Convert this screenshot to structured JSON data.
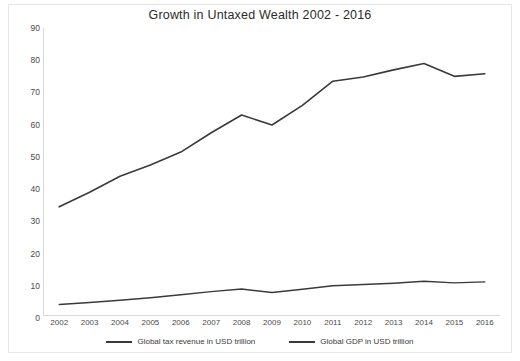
{
  "chart_data": {
    "type": "line",
    "title": "Growth in Untaxed Wealth 2002 - 2016",
    "xlabel": "",
    "ylabel": "",
    "ylim": [
      0,
      90
    ],
    "ytick_step": 10,
    "grid": false,
    "legend_position": "bottom",
    "categories": [
      "2002",
      "2003",
      "2004",
      "2005",
      "2006",
      "2007",
      "2008",
      "2009",
      "2010",
      "2011",
      "2012",
      "2013",
      "2014",
      "2015",
      "2016"
    ],
    "series": [
      {
        "name": "Global tax revenue in USD trillion",
        "color": "#3a3a3a",
        "values": [
          4.2,
          4.8,
          5.5,
          6.3,
          7.2,
          8.2,
          9.0,
          7.9,
          8.9,
          10.0,
          10.4,
          10.8,
          11.4,
          10.9,
          11.2
        ]
      },
      {
        "name": "Global GDP in USD trillion",
        "color": "#3a3a3a",
        "values": [
          34.5,
          39.0,
          44.0,
          47.5,
          51.5,
          57.5,
          63.0,
          59.9,
          66.0,
          73.5,
          74.8,
          77.0,
          79.0,
          75.0,
          75.8
        ]
      }
    ],
    "ytick_labels": [
      "90",
      "80",
      "70",
      "60",
      "50",
      "40",
      "30",
      "20",
      "10",
      "0"
    ],
    "yticks": [
      90,
      80,
      70,
      60,
      50,
      40,
      30,
      20,
      10,
      0
    ]
  },
  "legend": {
    "items": [
      {
        "label": "Global tax revenue in USD trillion"
      },
      {
        "label": "Global GDP in USD trillion"
      }
    ]
  }
}
